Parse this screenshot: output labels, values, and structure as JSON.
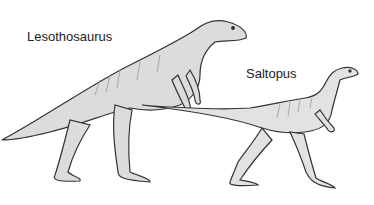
{
  "illustration": {
    "labels": {
      "lesothosaurus": "Lesothosaurus",
      "saltopus": "Saltopus"
    },
    "colors": {
      "background": "#ffffff",
      "outline": "#333333",
      "fill": "#d9d9d9",
      "shade": "#a8a8a8"
    }
  }
}
